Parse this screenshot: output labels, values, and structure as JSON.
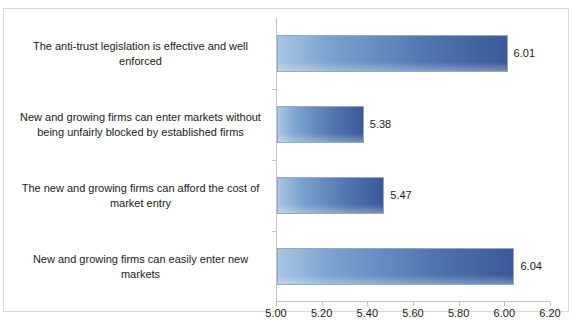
{
  "chart_data": {
    "type": "bar",
    "orientation": "horizontal",
    "title": "",
    "xlabel": "",
    "ylabel": "",
    "xlim": [
      5.0,
      6.2
    ],
    "grid": false,
    "legend": false,
    "xticks": [
      "5.00",
      "5.20",
      "5.40",
      "5.60",
      "5.80",
      "6.00",
      "6.20"
    ],
    "xtick_values": [
      5.0,
      5.2,
      5.4,
      5.6,
      5.8,
      6.0,
      6.2
    ],
    "categories": [
      "The anti-trust legislation is effective and well enforced",
      "New and growing firms can enter markets without being unfairly blocked by established firms",
      "The new and growing firms can afford the cost of market entry",
      "New and growing firms can easily enter new markets"
    ],
    "values": [
      6.01,
      5.38,
      5.47,
      6.04
    ],
    "value_labels": [
      "6.01",
      "5.38",
      "5.47",
      "6.04"
    ],
    "bar_color_start": "#a8c6e4",
    "bar_color_end": "#3b5998",
    "bar_border_color": "#9aa7b8",
    "axis_color": "#c2c2c2",
    "frame_color": "#d9d9d9",
    "text_color": "#1a1a1a"
  }
}
